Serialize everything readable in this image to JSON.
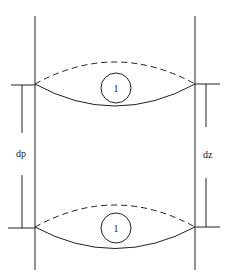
{
  "diagram": {
    "labels": {
      "left_dimension": "dp",
      "right_dimension": "dz",
      "top_marker": "1",
      "bottom_marker": "1"
    },
    "colors": {
      "stroke": "#222222",
      "background": "#ffffff"
    }
  }
}
